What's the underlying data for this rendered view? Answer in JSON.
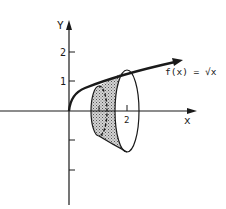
{
  "figure": {
    "y_axis_label": "Y",
    "x_axis_label": "x",
    "y_ticks": [
      {
        "label": "2",
        "value": 2
      },
      {
        "label": "1",
        "value": 1
      }
    ],
    "x_ticks": [
      {
        "label": "1",
        "value": 1
      },
      {
        "label": "2",
        "value": 2
      }
    ],
    "function_label": "f(x) = √x",
    "colors": {
      "ink": "#1a1a1a",
      "shading": "#b8b8b8",
      "background": "#ffffff"
    }
  }
}
